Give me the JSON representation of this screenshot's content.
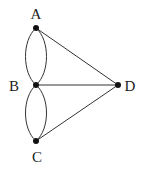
{
  "diagram": {
    "type": "multigraph",
    "nodes": [
      {
        "id": "A",
        "label": "A",
        "x": 36,
        "y": 28
      },
      {
        "id": "B",
        "label": "B",
        "x": 36,
        "y": 85
      },
      {
        "id": "C",
        "label": "C",
        "x": 36,
        "y": 141
      },
      {
        "id": "D",
        "label": "D",
        "x": 118,
        "y": 85
      }
    ],
    "edges": [
      {
        "from": "A",
        "to": "B",
        "style": "curve-left"
      },
      {
        "from": "A",
        "to": "B",
        "style": "curve-right"
      },
      {
        "from": "B",
        "to": "C",
        "style": "curve-left"
      },
      {
        "from": "B",
        "to": "C",
        "style": "curve-right"
      },
      {
        "from": "A",
        "to": "D",
        "style": "straight"
      },
      {
        "from": "B",
        "to": "D",
        "style": "straight"
      },
      {
        "from": "C",
        "to": "D",
        "style": "straight"
      }
    ],
    "labels": {
      "A": "A",
      "B": "B",
      "C": "C",
      "D": "D"
    }
  }
}
